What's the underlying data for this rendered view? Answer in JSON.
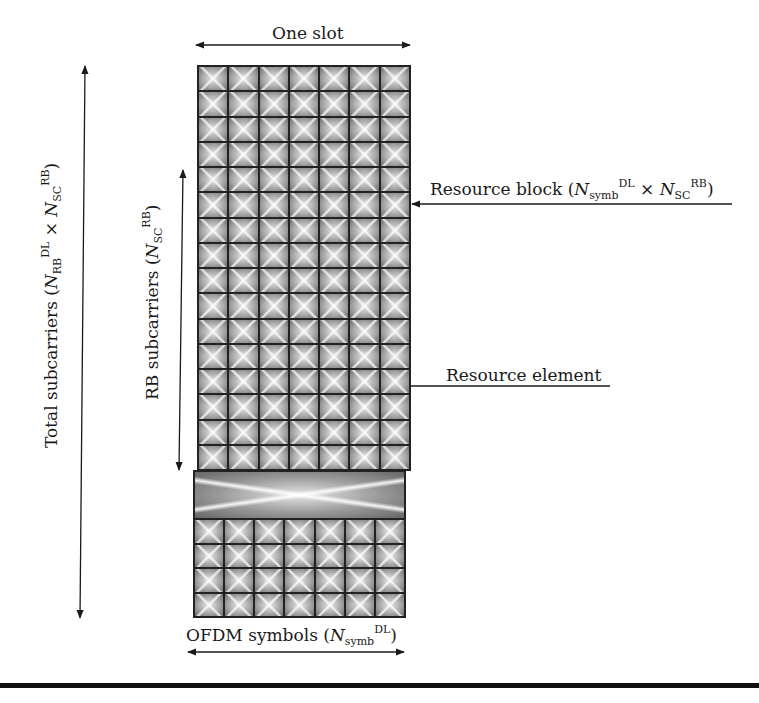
{
  "diagram": {
    "grid": {
      "columns": 7,
      "top_rows": 16,
      "bottom_rows": 4,
      "cell_symbol": "x-pattern",
      "colors": {
        "border": "#222222",
        "cell_light": "#e8e8e8",
        "cell_dark": "#6a6a6a"
      }
    },
    "labels": {
      "one_slot": "One slot",
      "resource_block": {
        "prefix": "Resource block (",
        "n1": "N",
        "n1_sub": "symb",
        "n1_sup": "DL",
        "times": " × ",
        "n2": "N",
        "n2_sub": "SC",
        "n2_sup": "RB",
        "suffix": ")"
      },
      "resource_element": "Resource element",
      "ofdm_symbols": {
        "prefix": "OFDM symbols (",
        "n": "N",
        "n_sub": "symb",
        "n_sup": "DL",
        "suffix": ")"
      },
      "rb_subcarriers": {
        "prefix": "RB subcarriers (",
        "n": "N",
        "n_sub": "SC",
        "n_sup": "RB",
        "suffix": ")"
      },
      "total_subcarriers": {
        "prefix": "Total subcarriers (",
        "n1": "N",
        "n1_sub": "RB",
        "n1_sup": "DL",
        "times": " × ",
        "n2": "N",
        "n2_sub": "SC",
        "n2_sup": "RB",
        "suffix": ")"
      }
    }
  }
}
